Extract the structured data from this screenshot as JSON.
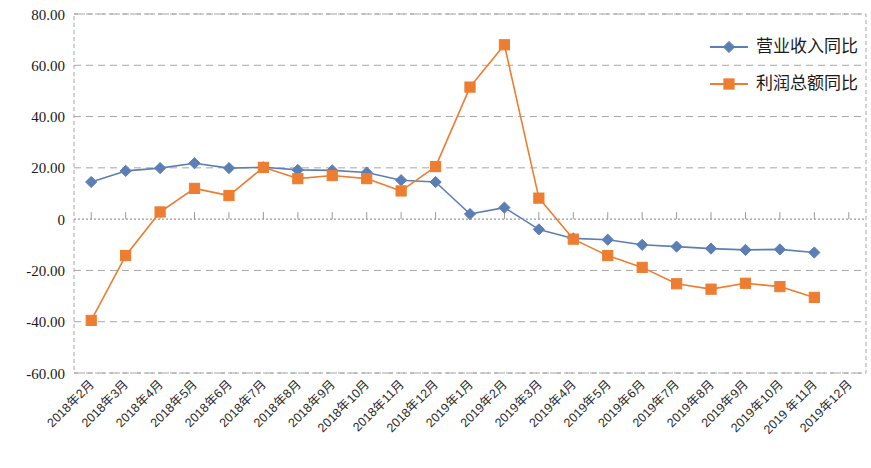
{
  "chart_data": {
    "type": "line",
    "title": "",
    "xlabel": "",
    "ylabel": "",
    "ylim": [
      -60,
      80
    ],
    "ytick_values": [
      80,
      60,
      40,
      20,
      0,
      -20,
      -40,
      -60
    ],
    "ytick_labels": [
      "80.00",
      "60.00",
      "40.00",
      "20.00",
      "0",
      "-20.00",
      "-40.00",
      "-60.00"
    ],
    "grid": true,
    "grid_style": "dashed-horizontal",
    "legend_position": "top-right",
    "categories": [
      "2018年2月",
      "2018年3月",
      "2018年4月",
      "2018年5月",
      "2018年6月",
      "2018年7月",
      "2018年8月",
      "2018年9月",
      "2018年10月",
      "2018年11月",
      "2018年12月",
      "2019年1月",
      "2019年2月",
      "2019年3月",
      "2019年4月",
      "2019年5月",
      "2019年6月",
      "2019年7月",
      "2019年8月",
      "2019年9月",
      "2019年10月",
      "2019 年11月",
      "2019年12月"
    ],
    "series": [
      {
        "name": "营业收入同比",
        "color": "#5B7FB5",
        "marker": "diamond",
        "values": [
          14.5,
          18.8,
          19.9,
          21.8,
          19.9,
          20.2,
          19.2,
          19.0,
          18.2,
          15.2,
          14.5,
          2.0,
          4.5,
          -4.0,
          -7.5,
          -8.0,
          -10.0,
          -10.7,
          -11.5,
          -12.0,
          -11.8,
          -13.0,
          null
        ]
      },
      {
        "name": "利润总额同比",
        "color": "#ED7D31",
        "marker": "square",
        "values": [
          -39.5,
          -14.2,
          2.8,
          12.0,
          9.2,
          20.2,
          15.8,
          17.0,
          15.8,
          11.0,
          20.5,
          51.5,
          68.0,
          8.2,
          -7.8,
          -14.2,
          -18.8,
          -25.2,
          -27.3,
          -25.0,
          -26.3,
          -30.5,
          null
        ]
      }
    ]
  },
  "legend": {
    "items": [
      {
        "label": "营业收入同比",
        "color": "#5B7FB5",
        "marker": "diamond"
      },
      {
        "label": "利润总额同比",
        "color": "#ED7D31",
        "marker": "square"
      }
    ]
  },
  "colors": {
    "series_blue": "#5B7FB5",
    "series_orange": "#ED7D31",
    "grid": "#a6a6a6",
    "axis": "#808080",
    "text": "#1a1a1a"
  }
}
